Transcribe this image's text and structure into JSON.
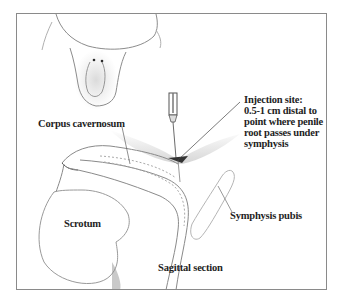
{
  "figure": {
    "labels": {
      "injection_site": {
        "lines": [
          "Injection site:",
          "0.5-1 cm distal to",
          "point where penile",
          "root passes under",
          "symphysis"
        ]
      },
      "corpus_cavernosum": "Corpus cavernosum",
      "symphysis_pubis": "Symphysis pubis",
      "scrotum": "Scrotum",
      "sagittal_section": "Sagittal section"
    },
    "colors": {
      "frame": "#8a8a8a",
      "ink": "#1e1e1e",
      "shading": "#9a9a9a",
      "background": "#ffffff"
    }
  }
}
